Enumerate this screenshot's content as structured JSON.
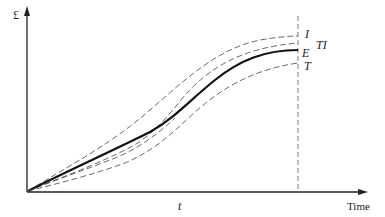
{
  "diagram": {
    "y_axis_label": "£",
    "x_axis_label": "Time",
    "time_marker_label": "t",
    "curves": [
      {
        "id": "I",
        "label": "I",
        "style": "dashed"
      },
      {
        "id": "TI",
        "label": "TI",
        "style": "dashed"
      },
      {
        "id": "E",
        "label": "E",
        "style": "solid-bold"
      },
      {
        "id": "T",
        "label": "T",
        "style": "dashed"
      }
    ],
    "colors": {
      "axis": "#222222",
      "solid_curve": "#111111",
      "dashed_curve": "#444444",
      "background": "#ffffff"
    }
  }
}
